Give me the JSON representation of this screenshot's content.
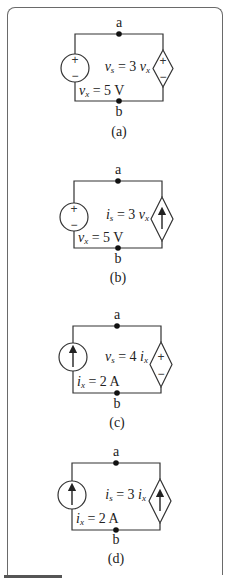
{
  "circuits": [
    {
      "id": "a",
      "caption": "(a)",
      "node_top": "a",
      "node_bottom": "b",
      "left_source": {
        "type": "voltage",
        "label_var": "v",
        "label_sub": "x",
        "label_rest": " = 5 V"
      },
      "right_source": {
        "type": "dependent-voltage",
        "label_var": "v",
        "label_sub": "s",
        "label_rest": " = 3 ",
        "ctrl_var": "v",
        "ctrl_sub": "x"
      }
    },
    {
      "id": "b",
      "caption": "(b)",
      "node_top": "a",
      "node_bottom": "b",
      "left_source": {
        "type": "voltage",
        "label_var": "v",
        "label_sub": "x",
        "label_rest": " = 5 V"
      },
      "right_source": {
        "type": "dependent-current",
        "label_var": "i",
        "label_sub": "s",
        "label_rest": " = 3 ",
        "ctrl_var": "v",
        "ctrl_sub": "x"
      }
    },
    {
      "id": "c",
      "caption": "(c)",
      "node_top": "a",
      "node_bottom": "b",
      "left_source": {
        "type": "current",
        "label_var": "i",
        "label_sub": "x",
        "label_rest": " = 2 A"
      },
      "right_source": {
        "type": "dependent-voltage",
        "label_var": "v",
        "label_sub": "s",
        "label_rest": " = 4 ",
        "ctrl_var": "i",
        "ctrl_sub": "x"
      }
    },
    {
      "id": "d",
      "caption": "(d)",
      "node_top": "a",
      "node_bottom": "b",
      "left_source": {
        "type": "current",
        "label_var": "i",
        "label_sub": "x",
        "label_rest": " = 2 A"
      },
      "right_source": {
        "type": "dependent-current",
        "label_var": "i",
        "label_sub": "s",
        "label_rest": " = 3 ",
        "ctrl_var": "i",
        "ctrl_sub": "x"
      }
    }
  ],
  "symbols": {
    "plus": "+",
    "minus": "−"
  }
}
